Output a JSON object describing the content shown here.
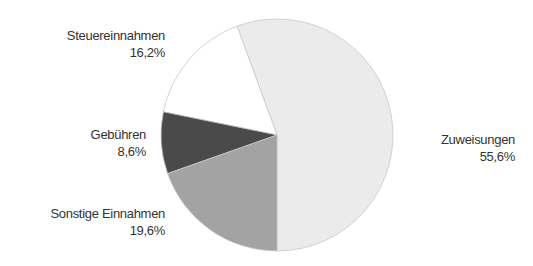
{
  "chart_data": {
    "type": "pie",
    "title": "",
    "slices": [
      {
        "label": "Zuweisungen",
        "value": 55.6,
        "display": "55,6%",
        "color": "#ebebeb"
      },
      {
        "label": "Steuereinnahmen",
        "value": 16.2,
        "display": "16,2%",
        "color": "#ffffff"
      },
      {
        "label": "Gebühren",
        "value": 8.6,
        "display": "8,6%",
        "color": "#4a4a4a"
      },
      {
        "label": "Sonstige Einnahmen",
        "value": 19.6,
        "display": "19,6%",
        "color": "#a3a3a3"
      }
    ],
    "start_angle_deg": 180,
    "direction": "counterclockwise",
    "legend": "none (direct labels)"
  }
}
